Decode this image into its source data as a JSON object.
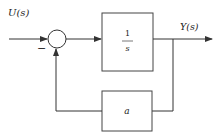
{
  "diagram": {
    "type": "block-diagram",
    "input_label": "U(s)",
    "output_label": "Y(s)",
    "summing_junction": {
      "feedback_sign": "−"
    },
    "forward_block": {
      "numerator": "1",
      "denominator": "s"
    },
    "feedback_block": {
      "label": "a"
    },
    "colors": {
      "line": "#333333",
      "background": "#ffffff"
    }
  }
}
